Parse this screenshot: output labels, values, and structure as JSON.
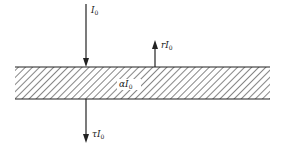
{
  "diagram": {
    "type": "slab-radiation-balance",
    "slab": {
      "x1": 15,
      "x2": 270,
      "y_top": 67,
      "y_bottom": 99,
      "fill": "hatched"
    },
    "labels": {
      "incident": {
        "prefix": "I",
        "sub": "0"
      },
      "reflected": {
        "prefix": "rI",
        "sub": "0"
      },
      "absorbed": {
        "prefix": "αI",
        "sub": "0"
      },
      "transmitted": {
        "prefix": "τI",
        "sub": "0"
      }
    },
    "arrows": [
      {
        "name": "incident",
        "direction": "down",
        "x": 86,
        "y1": 4,
        "y2": 67
      },
      {
        "name": "reflected",
        "direction": "up",
        "x": 155,
        "y1": 67,
        "y2": 40
      },
      {
        "name": "transmitted",
        "direction": "down",
        "x": 86,
        "y1": 99,
        "y2": 143
      }
    ],
    "colors": {
      "line": "#222222",
      "hatch": "#444444",
      "background": "#ffffff"
    }
  }
}
